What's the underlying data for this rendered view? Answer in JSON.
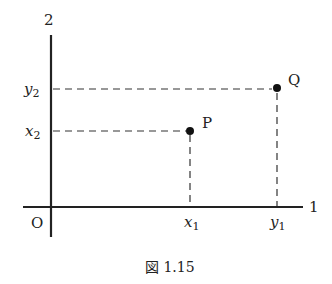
{
  "figure": {
    "caption": "図 1.15",
    "axes": {
      "vertical_label": "2",
      "horizontal_label": "1",
      "origin_label": "O"
    },
    "ticks": {
      "y2": {
        "base": "y",
        "sub": "2"
      },
      "x2": {
        "base": "x",
        "sub": "2"
      },
      "x1": {
        "base": "x",
        "sub": "1"
      },
      "y1": {
        "base": "y",
        "sub": "1"
      }
    },
    "points": [
      {
        "name": "P",
        "coords": "(x1, x2)"
      },
      {
        "name": "Q",
        "coords": "(y1, y2)"
      }
    ],
    "colors": {
      "ink": "#222222",
      "background": "#ffffff"
    }
  }
}
